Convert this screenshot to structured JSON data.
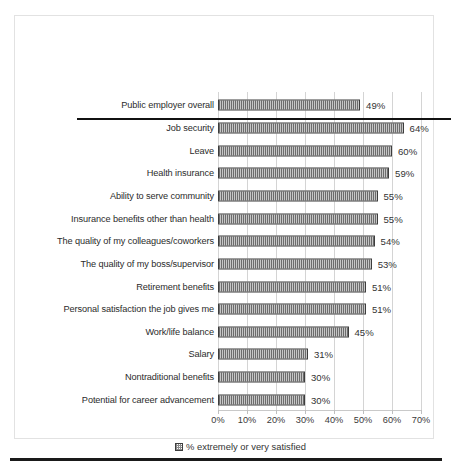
{
  "chart_data": {
    "type": "bar",
    "orientation": "horizontal",
    "title": "",
    "subtitle": "",
    "xlabel": "",
    "ylabel": "",
    "xlim": [
      0,
      70
    ],
    "xtick_labels": [
      "0%",
      "10%",
      "20%",
      "30%",
      "40%",
      "50%",
      "60%",
      "70%"
    ],
    "xticks": [
      0,
      10,
      20,
      30,
      40,
      50,
      60,
      70
    ],
    "grid": true,
    "grid_axis": "x",
    "legend_position": "bottom-center",
    "legend": [
      "% extremely or very satisfied"
    ],
    "series_name": "% extremely or very satisfied",
    "value_label_suffix": "%",
    "categories": [
      "Public employer overall",
      "Job security",
      "Leave",
      "Health insurance",
      "Ability to serve community",
      "Insurance benefits other than health",
      "The quality of my colleagues/coworkers",
      "The quality of my boss/supervisor",
      "Retirement benefits",
      "Personal satisfaction the job gives me",
      "Work/life balance",
      "Salary",
      "Nontraditional benefits",
      "Potential for career advancement"
    ],
    "values": [
      49,
      64,
      60,
      59,
      55,
      55,
      54,
      53,
      51,
      51,
      45,
      31,
      30,
      30
    ],
    "data_labels": [
      "49%",
      "64%",
      "60%",
      "59%",
      "55%",
      "55%",
      "54%",
      "53%",
      "51%",
      "51%",
      "45%",
      "31%",
      "30%",
      "30%"
    ],
    "separator_after_index": 0,
    "bar_fill": "#8c8c8c",
    "bar_border": "#3d3d3d",
    "grid_color": "#d4d4d4",
    "text_color": "#2b2b2b"
  },
  "rows": [
    {
      "label": "Public employer overall",
      "value": 49,
      "data_label": "49%"
    },
    {
      "label": "Job security",
      "value": 64,
      "data_label": "64%"
    },
    {
      "label": "Leave",
      "value": 60,
      "data_label": "60%"
    },
    {
      "label": "Health insurance",
      "value": 59,
      "data_label": "59%"
    },
    {
      "label": "Ability to serve community",
      "value": 55,
      "data_label": "55%"
    },
    {
      "label": "Insurance benefits other than health",
      "value": 55,
      "data_label": "55%"
    },
    {
      "label": "The quality of my colleagues/coworkers",
      "value": 54,
      "data_label": "54%"
    },
    {
      "label": "The quality of my boss/supervisor",
      "value": 53,
      "data_label": "53%"
    },
    {
      "label": "Retirement benefits",
      "value": 51,
      "data_label": "51%"
    },
    {
      "label": "Personal satisfaction the job gives me",
      "value": 51,
      "data_label": "51%"
    },
    {
      "label": "Work/life balance",
      "value": 45,
      "data_label": "45%"
    },
    {
      "label": "Salary",
      "value": 31,
      "data_label": "31%"
    },
    {
      "label": "Nontraditional benefits",
      "value": 30,
      "data_label": "30%"
    },
    {
      "label": "Potential for career advancement",
      "value": 30,
      "data_label": "30%"
    }
  ],
  "axis": {
    "ticks": [
      "0%",
      "10%",
      "20%",
      "30%",
      "40%",
      "50%",
      "60%",
      "70%"
    ]
  },
  "legend": {
    "swatch": "checker-pattern-swatch",
    "text": "% extremely or very satisfied"
  }
}
